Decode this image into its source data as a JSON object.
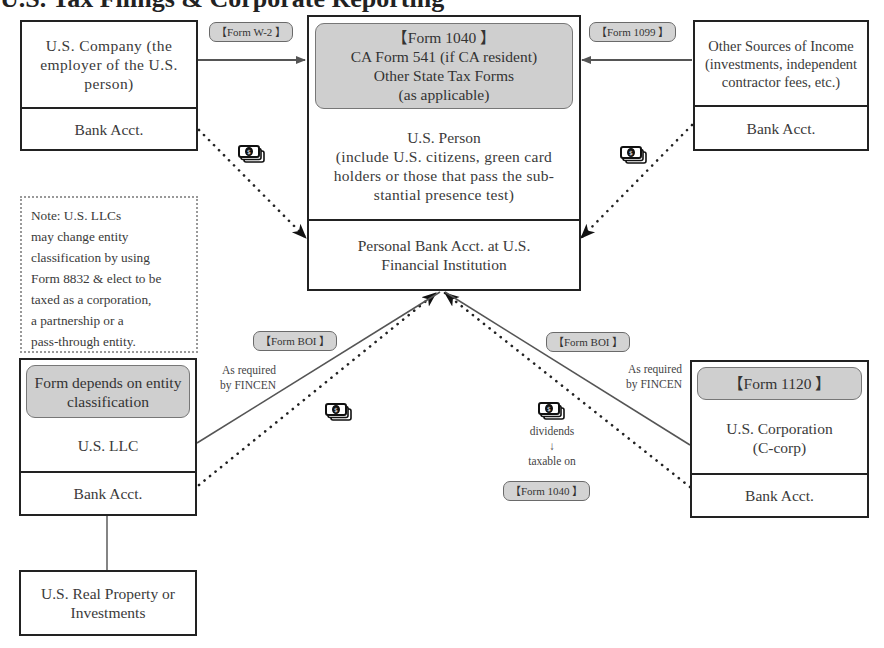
{
  "title_fragment": "U.S. Tax Filings & Corporate Reporting",
  "nodes": {
    "us_company": {
      "label": "U.S. Company (the employer of the U.S. person)",
      "bank": "Bank Acct."
    },
    "us_person": {
      "forms_line1": "【Form 1040 】",
      "forms_line2": "CA Form 541 (if CA resident)",
      "forms_line3": "Other State Tax Forms",
      "forms_line4": "(as applicable)",
      "label_line1": "U.S. Person",
      "label_line2": "(include U.S. citizens, green card holders or those that pass the sub-stantial presence test)",
      "bank": "Personal Bank Acct. at U.S. Financial Institution"
    },
    "other_sources": {
      "label": "Other Sources of Income (investments, independent contractor fees, etc.)",
      "bank": "Bank Acct."
    },
    "us_llc": {
      "form": "Form depends on entity classification",
      "label": "U.S. LLC",
      "bank": "Bank Acct."
    },
    "us_corporation": {
      "form": "【Form 1120 】",
      "label_line1": "U.S. Corporation",
      "label_line2": "(C-corp)",
      "bank": "Bank Acct."
    },
    "real_property": {
      "label": "U.S. Real Property or Investments"
    }
  },
  "note": {
    "lines": [
      "Note: U.S. LLCs",
      "may change entity",
      "classification by using",
      "Form 8832 & elect to be",
      "taxed as a corporation,",
      "a partnership or a",
      "pass-through entity."
    ]
  },
  "edge_labels": {
    "w2": "【Form W-2 】",
    "f1099": "【Form 1099 】",
    "boi_left": "【Form BOI 】",
    "boi_right": "【Form BOI 】",
    "fincen_left_1": "As required",
    "fincen_left_2": "by FINCEN",
    "fincen_right_1": "As required",
    "fincen_right_2": "by FINCEN",
    "dividends": "dividends",
    "arrow_down": "↓",
    "taxable_on": "taxable on",
    "f1040_small": "【Form 1040 】"
  },
  "icons": {
    "money": "money-bills-icon"
  },
  "colors": {
    "box_border": "#222222",
    "gray_fill": "#cfcfcf",
    "pill_fill": "#d3d3d3",
    "line": "#555555",
    "text": "#3a3a3a"
  }
}
